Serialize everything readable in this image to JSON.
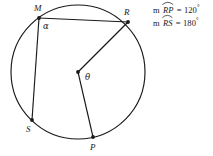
{
  "figure": {
    "type": "circle-geometry-diagram",
    "circle": {
      "center_x": 78,
      "center_y": 72,
      "radius": 67,
      "stroke": "#1a1a1a"
    },
    "center_point_label": "",
    "points": [
      {
        "name": "M",
        "label": "M",
        "x": 39,
        "y": 18,
        "label_x": 34,
        "label_y": 11
      },
      {
        "name": "R",
        "label": "R",
        "x": 128,
        "y": 22,
        "label_x": 124,
        "label_y": 15
      },
      {
        "name": "S",
        "label": "S",
        "x": 32,
        "y": 120,
        "label_x": 26,
        "label_y": 132
      },
      {
        "name": "P",
        "label": "P",
        "x": 93,
        "y": 137,
        "label_x": 90,
        "label_y": 150
      }
    ],
    "angle_labels": [
      {
        "name": "alpha",
        "label": "α",
        "x": 43,
        "y": 29
      },
      {
        "name": "theta",
        "label": "θ",
        "x": 85,
        "y": 80
      }
    ],
    "segments": [
      {
        "name": "chord-M-R",
        "from": "M",
        "to": "R"
      },
      {
        "name": "chord-M-S",
        "from": "M",
        "to": "S"
      },
      {
        "name": "radius-center-R",
        "from": "center",
        "to": "R"
      },
      {
        "name": "radius-center-P",
        "from": "center",
        "to": "P"
      }
    ]
  },
  "measures": [
    {
      "prefix": "m",
      "arc": "RP",
      "equals": "=",
      "value": "120",
      "degree": "°",
      "full_text": "m arc RP = 120°"
    },
    {
      "prefix": "m",
      "arc": "RS",
      "equals": "=",
      "value": "180",
      "degree": "°",
      "full_text": "m arc RS = 180°"
    }
  ],
  "colors": {
    "stroke": "#1a1a1a",
    "background": "#ffffff",
    "text": "#1a1a1a"
  }
}
